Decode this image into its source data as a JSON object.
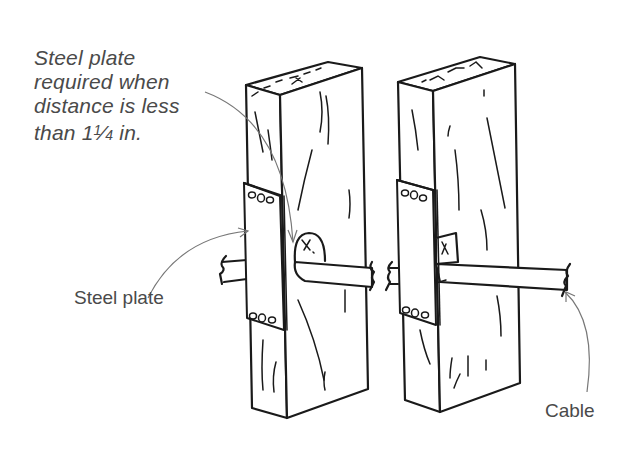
{
  "figure": {
    "callouts": {
      "note": {
        "lines": [
          "Steel plate",
          "required when",
          "distance is less",
          "than 1"
        ],
        "fraction_numerator": "1",
        "fraction_denominator": "4",
        "suffix": " in."
      },
      "steel_plate": "Steel plate",
      "cable": "Cable"
    },
    "elements": [
      {
        "name": "left-stud",
        "description": "Wood stud with bored hole, steel plate on edge"
      },
      {
        "name": "right-stud",
        "description": "Wood stud with notch, steel plate on edge"
      },
      {
        "name": "cable",
        "description": "Cable passing through both studs, broken ends"
      },
      {
        "name": "steel-plate-left",
        "description": "Nail plate with 3 holes top and bottom"
      },
      {
        "name": "steel-plate-right",
        "description": "Nail plate with 3 holes top and bottom"
      }
    ],
    "colors": {
      "ink": "#1a1a1a",
      "label_text": "#4a4a4a",
      "leader_line": "#777777",
      "background": "#ffffff"
    }
  }
}
